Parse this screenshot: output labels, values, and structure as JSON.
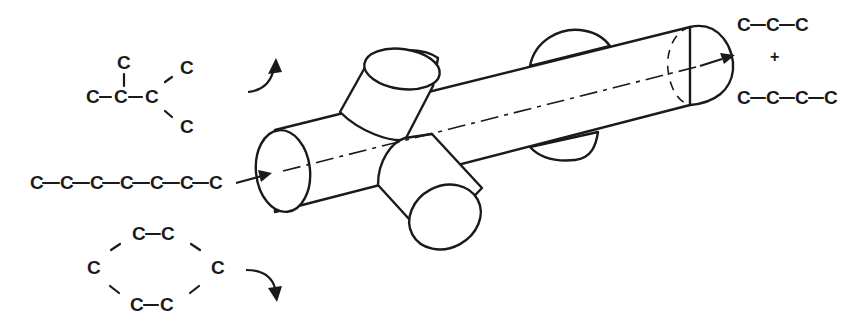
{
  "figure": {
    "colors": {
      "ink": "#1a1a1a",
      "background": "#ffffff"
    }
  },
  "molecules": {
    "branched": {
      "label": "branched alkane (excluded)",
      "atoms": [
        "C",
        "C",
        "C",
        "C",
        "C",
        "C"
      ]
    },
    "linear": {
      "label": "linear heptane (admitted)",
      "atoms": [
        "C",
        "C",
        "C",
        "C",
        "C",
        "C",
        "C"
      ]
    },
    "cyclic": {
      "label": "cyclic hexane (excluded)",
      "atoms": [
        "C",
        "C",
        "C",
        "C",
        "C",
        "C"
      ]
    }
  },
  "products": {
    "product_1": {
      "label": "propane",
      "atoms": [
        "C",
        "C",
        "C"
      ]
    },
    "plus_sign": "+",
    "product_2": {
      "label": "butane",
      "atoms": [
        "C",
        "C",
        "C",
        "C"
      ]
    }
  },
  "arrows": {
    "entry": "linear molecule enters channel",
    "exit": "cracked products leave channel",
    "branched_reject": "branched molecule deflected upward",
    "cyclic_reject": "cyclic molecule deflected downward"
  },
  "channel": {
    "label": "zeolite pore channel with intersecting side channels"
  }
}
